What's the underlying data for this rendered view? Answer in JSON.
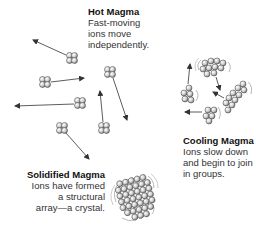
{
  "diagram": {
    "stages": [
      {
        "id": "hot",
        "title": "Hot Magma",
        "description": "Fast-moving\nions move\nindependently."
      },
      {
        "id": "cooling",
        "title": "Cooling Magma",
        "description": "Ions slow down\nand begin to join\nin groups."
      },
      {
        "id": "solid",
        "title": "Solidified Magma",
        "description": "Ions have formed\na structural\narray—a crystal."
      }
    ],
    "icons": {
      "ion_cluster": "ion-cluster-icon",
      "motion_arrow": "arrow-icon",
      "vibration_lines": "vibration-icon",
      "crystal": "crystal-lattice-icon"
    },
    "colors": {
      "ion_fill": "#d9d9d9",
      "ion_stroke": "#555555",
      "arrow": "#333333",
      "text": "#222222"
    }
  }
}
